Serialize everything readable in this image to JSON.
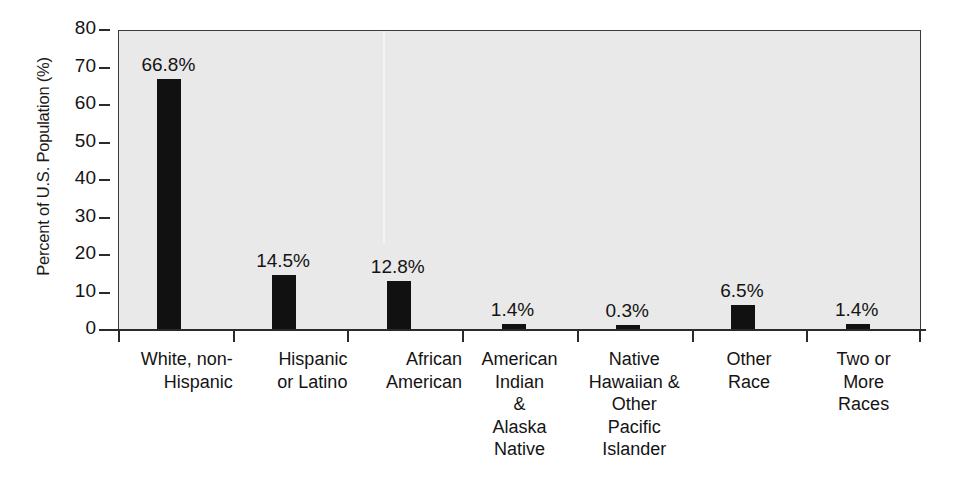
{
  "chart_data": {
    "type": "bar",
    "title": "",
    "xlabel": "",
    "ylabel": "Percent of U.S. Population (%)",
    "ylim": [
      0,
      80
    ],
    "ytick_values": [
      80,
      70,
      60,
      50,
      40,
      30,
      20,
      10,
      0
    ],
    "ytick_labels": [
      "80",
      "70",
      "60",
      "50",
      "40",
      "30",
      "20",
      "10",
      "0"
    ],
    "grid": false,
    "legend": "none",
    "bar_color": "#111111",
    "plot_background": "#e9e9e9",
    "axis_color": "#2a2a2a",
    "categories": [
      "White, non-Hispanic",
      "Hispanic or Latino",
      "African American",
      "American Indian & Alaska Native",
      "Native Hawaiian & Other Pacific Islander",
      "Other Race",
      "Two or More Races"
    ],
    "category_label_lines": [
      [
        "White, non-",
        "Hispanic"
      ],
      [
        "Hispanic",
        "or Latino"
      ],
      [
        "African",
        "American"
      ],
      [
        "American",
        "Indian",
        "&",
        "Alaska",
        "Native"
      ],
      [
        "Native",
        "Hawaiian &",
        "Other",
        "Pacific",
        "Islander"
      ],
      [
        "Other",
        "Race"
      ],
      [
        "Two or",
        "More",
        "Races"
      ]
    ],
    "values": [
      66.8,
      14.5,
      12.8,
      1.4,
      0.3,
      6.5,
      1.4
    ],
    "data_labels": [
      "66.8%",
      "14.5%",
      "12.8%",
      "1.4%",
      "0.3%",
      "6.5%",
      "1.4%"
    ]
  }
}
